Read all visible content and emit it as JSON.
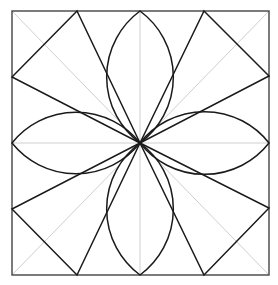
{
  "diagram": {
    "title": "",
    "colors": {
      "background": "#ffffff",
      "border": "#444444",
      "guide": "#cfcfcf",
      "shape": "#1a1a1a"
    },
    "square": {
      "x1": 12,
      "y1": 11,
      "x2": 269,
      "y2": 275
    },
    "center": {
      "x": 140,
      "y": 143
    },
    "guides": [
      {
        "name": "vertical-center-line",
        "x1": 140,
        "y1": 11,
        "x2": 140,
        "y2": 275
      },
      {
        "name": "horizontal-center-line",
        "x1": 12,
        "y1": 143,
        "x2": 269,
        "y2": 143
      },
      {
        "name": "diagonal-tl-br",
        "x1": 12,
        "y1": 11,
        "x2": 269,
        "y2": 275
      },
      {
        "name": "diagonal-tr-bl",
        "x1": 269,
        "y1": 11,
        "x2": 12,
        "y2": 275
      }
    ],
    "kites": [
      {
        "name": "kite-top-left",
        "points": [
          [
            140,
            143
          ],
          [
            77,
            11
          ],
          [
            12,
            77
          ]
        ]
      },
      {
        "name": "kite-top-right",
        "points": [
          [
            140,
            143
          ],
          [
            204,
            11
          ],
          [
            269,
            76
          ]
        ]
      },
      {
        "name": "kite-bottom-right",
        "points": [
          [
            140,
            143
          ],
          [
            269,
            208
          ],
          [
            204,
            275
          ]
        ]
      },
      {
        "name": "kite-bottom-left",
        "points": [
          [
            140,
            143
          ],
          [
            77,
            275
          ],
          [
            12,
            209
          ]
        ]
      }
    ],
    "petals": [
      {
        "name": "petal-top",
        "tip": [
          140,
          11
        ],
        "radius": 82
      },
      {
        "name": "petal-right",
        "tip": [
          269,
          143
        ],
        "radius": 82
      },
      {
        "name": "petal-bottom",
        "tip": [
          140,
          275
        ],
        "radius": 82
      },
      {
        "name": "petal-left",
        "tip": [
          12,
          143
        ],
        "radius": 82
      }
    ]
  }
}
